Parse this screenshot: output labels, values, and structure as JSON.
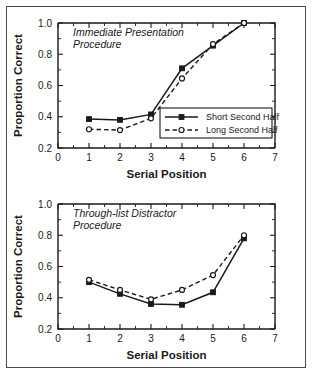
{
  "figure": {
    "border_color": "#4a4a4a",
    "background": "#ffffff"
  },
  "chart_data": [
    {
      "type": "line",
      "panel_id": "immediate-presentation",
      "title": "Immediate Presentation Procedure",
      "title_line1": "Immediate Presentation",
      "title_line2": "Procedure",
      "xlabel": "Serial Position",
      "ylabel": "Proportion Correct",
      "x": [
        1,
        2,
        3,
        4,
        5,
        6
      ],
      "xlim": [
        0,
        7
      ],
      "ylim": [
        0.2,
        1.0
      ],
      "xticks": [
        0,
        1,
        2,
        3,
        4,
        5,
        6,
        7
      ],
      "xticklabels": [
        "0",
        "1",
        "2",
        "3",
        "4",
        "5",
        "6",
        "7"
      ],
      "yticks": [
        0.2,
        0.4,
        0.6,
        0.8,
        1.0
      ],
      "yticklabels": [
        "0.2",
        "0.4",
        "0.6",
        "0.8",
        "1.0"
      ],
      "grid": false,
      "legend_position": "lower right",
      "series": [
        {
          "name": "Short Second Half",
          "marker": "filled-square",
          "linestyle": "solid",
          "values": [
            0.385,
            0.38,
            0.415,
            0.71,
            0.855,
            1.0
          ]
        },
        {
          "name": "Long Second Half",
          "marker": "open-circle",
          "linestyle": "dashed",
          "values": [
            0.32,
            0.315,
            0.39,
            0.645,
            0.865,
            1.0
          ]
        }
      ]
    },
    {
      "type": "line",
      "panel_id": "through-list-distractor",
      "title": "Through-list Distractor Procedure",
      "title_line1": "Through-list Distractor",
      "title_line2": "Procedure",
      "xlabel": "Serial Position",
      "ylabel": "Proportion Correct",
      "x": [
        1,
        2,
        3,
        4,
        5,
        6
      ],
      "xlim": [
        0,
        7
      ],
      "ylim": [
        0.2,
        1.0
      ],
      "xticks": [
        0,
        1,
        2,
        3,
        4,
        5,
        6,
        7
      ],
      "xticklabels": [
        "0",
        "1",
        "2",
        "3",
        "4",
        "5",
        "6",
        "7"
      ],
      "yticks": [
        0.2,
        0.4,
        0.6,
        0.8,
        1.0
      ],
      "yticklabels": [
        "0.2",
        "0.4",
        "0.6",
        "0.8",
        "1.0"
      ],
      "grid": false,
      "legend_position": "none",
      "series": [
        {
          "name": "Short Second Half",
          "marker": "filled-square",
          "linestyle": "solid",
          "values": [
            0.5,
            0.425,
            0.36,
            0.355,
            0.435,
            0.78
          ]
        },
        {
          "name": "Long Second Half",
          "marker": "open-circle",
          "linestyle": "dashed",
          "values": [
            0.515,
            0.45,
            0.39,
            0.45,
            0.545,
            0.8
          ]
        }
      ]
    }
  ]
}
